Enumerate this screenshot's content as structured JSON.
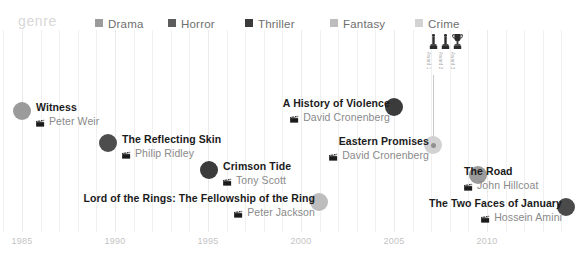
{
  "chart_data": {
    "type": "scatter",
    "title": "",
    "xlabel": "",
    "ylabel": "",
    "xlim": [
      1984,
      2014
    ],
    "grid": true,
    "legend_position": "top",
    "legend_title": "genre",
    "categories": [
      "Drama",
      "Horror",
      "Thriller",
      "Fantasy",
      "Crime"
    ],
    "series": [
      {
        "name": "Witness",
        "director": "Peter Weir",
        "year": 1985,
        "genre": "Thriller"
      },
      {
        "name": "The Reflecting Skin",
        "director": "Philip Ridley",
        "year": 1990,
        "genre": "Horror"
      },
      {
        "name": "Crimson Tide",
        "director": "Tony Scott",
        "year": 1995,
        "genre": "Thriller"
      },
      {
        "name": "Lord of the Rings: The Fellowship of the Ring",
        "director": "Peter Jackson",
        "year": 2001,
        "genre": "Fantasy"
      },
      {
        "name": "A History of Violence",
        "director": "David Cronenberg",
        "year": 2005,
        "genre": "Thriller"
      },
      {
        "name": "Eastern Promises",
        "director": "David Cronenberg",
        "year": 2007,
        "genre": "Crime"
      },
      {
        "name": "The Road",
        "director": "John Hillcoat",
        "year": 2009,
        "genre": "Drama"
      },
      {
        "name": "The Two Faces of January",
        "director": "Hossein Amini",
        "year": 2014,
        "genre": "Thriller"
      }
    ],
    "x_ticks": [
      1985,
      1990,
      1995,
      2000,
      2005,
      2010
    ]
  },
  "legend": {
    "title": "genre",
    "items": [
      {
        "label": "Drama",
        "color": "#9b9b9b",
        "x": 95
      },
      {
        "label": "Horror",
        "color": "#5c5c5c",
        "x": 168
      },
      {
        "label": "Thriller",
        "color": "#3b3b3b",
        "x": 245
      },
      {
        "label": "Fantasy",
        "color": "#bdbdbd",
        "x": 330
      },
      {
        "label": "Crime",
        "color": "#d2d2d2",
        "x": 415
      }
    ]
  },
  "films": [
    {
      "title": "Witness",
      "director": "Peter Weir",
      "genre": "Drama",
      "color": "#9b9b9b",
      "dot_x": 22,
      "dot_y": 111,
      "text_x": 36,
      "text_y": 111,
      "align": "left"
    },
    {
      "title": "The Reflecting Skin",
      "director": "Philip Ridley",
      "genre": "Horror",
      "color": "#4d4d4d",
      "dot_x": 108,
      "dot_y": 143,
      "text_x": 122,
      "text_y": 143,
      "align": "left"
    },
    {
      "title": "Crimson Tide",
      "director": "Tony Scott",
      "genre": "Thriller",
      "color": "#3b3b3b",
      "dot_x": 209,
      "dot_y": 170,
      "text_x": 223,
      "text_y": 170,
      "align": "left"
    },
    {
      "title": "Lord of the Rings: The Fellowship of the Ring",
      "director": "Peter Jackson",
      "genre": "Fantasy",
      "color": "#bdbdbd",
      "dot_x": 319,
      "dot_y": 202,
      "text_x": 315,
      "text_y": 202,
      "align": "right"
    },
    {
      "title": "A History of Violence",
      "director": "David Cronenberg",
      "genre": "Thriller",
      "color": "#3b3b3b",
      "dot_x": 394,
      "dot_y": 107,
      "text_x": 390,
      "text_y": 107,
      "align": "right"
    },
    {
      "title": "Eastern Promises",
      "director": "David Cronenberg",
      "genre": "Crime",
      "color": "#d2d2d2",
      "dot_x": 433,
      "dot_y": 145,
      "text_x": 429,
      "text_y": 145,
      "align": "right"
    },
    {
      "title": "The Road",
      "director": "John Hillcoat",
      "genre": "Drama",
      "color": "#9b9b9b",
      "dot_x": 478,
      "dot_y": 175,
      "text_x": 464,
      "text_y": 175,
      "align": "left"
    },
    {
      "title": "The Two Faces of January",
      "director": "Hossein Amini",
      "genre": "Thriller",
      "color": "#4a4a4a",
      "dot_x": 566,
      "dot_y": 207,
      "text_x": 562,
      "text_y": 207,
      "align": "right"
    }
  ],
  "awards": {
    "connector": {
      "x": 433,
      "top": 75,
      "height": 62
    },
    "items": [
      {
        "icon": "award-statuette-icon",
        "label": "Award 1",
        "x": 428
      },
      {
        "icon": "award-statuette-icon",
        "label": "Award 2",
        "x": 440
      },
      {
        "icon": "award-trophy-icon",
        "label": "Award 3",
        "x": 452
      }
    ]
  },
  "axis": {
    "ticks": [
      {
        "label": "1985",
        "x": 22
      },
      {
        "label": "1990",
        "x": 115
      },
      {
        "label": "1995",
        "x": 208
      },
      {
        "label": "2000",
        "x": 301
      },
      {
        "label": "2005",
        "x": 394
      },
      {
        "label": "2010",
        "x": 487
      }
    ],
    "y": 236
  }
}
